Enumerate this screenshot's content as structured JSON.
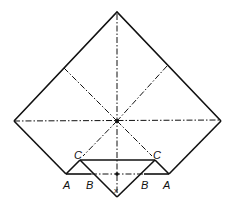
{
  "diagram": {
    "type": "origami-fold",
    "labels": {
      "A_left": "A",
      "B_left": "B",
      "C_left": "C",
      "C_right": "C",
      "B_right": "B",
      "A_right": "A",
      "x_mark": "x"
    },
    "colors": {
      "stroke": "#111111",
      "background": "#ffffff"
    }
  }
}
